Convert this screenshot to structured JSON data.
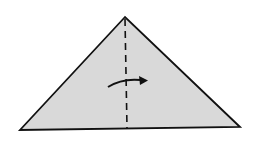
{
  "diagram": {
    "type": "origami-step",
    "shape": "triangle",
    "paper_color": "#d9d9d9",
    "line_color": "#111111",
    "background": "#ffffff",
    "triangle": {
      "apex": [
        125,
        17
      ],
      "left": [
        20,
        130
      ],
      "right": [
        240,
        127
      ]
    },
    "fold_line": {
      "style": "valley-dashed",
      "from": [
        125,
        18
      ],
      "to": [
        127,
        128
      ]
    },
    "arrow": {
      "direction": "right",
      "meaning": "fold left half over to the right"
    }
  }
}
